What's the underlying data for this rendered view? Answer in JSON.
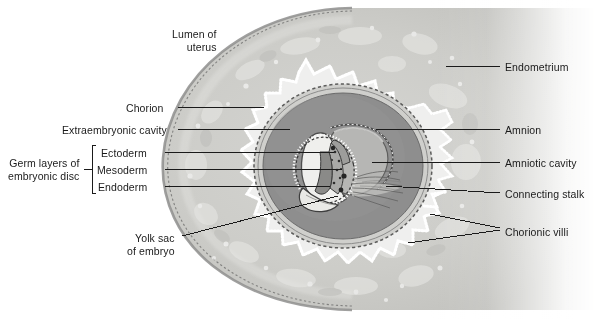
{
  "figure": {
    "background": "#ffffff"
  },
  "palette": {
    "endometrium_light": "#d8d8d6",
    "endometrium_mid": "#c9c9c6",
    "endometrium_rim": "#9a9a99",
    "extraembryonic_cavity": "#8e8e8e",
    "amniotic_cavity": "#b6b6b4",
    "yolk_sac": "#e9e9e6",
    "villi_white": "#fdfdfd",
    "line": "#1a1a1a",
    "text": "#1a1a1a"
  },
  "labels_left": [
    {
      "id": "lumen-of-uterus",
      "text": "Lumen of\nuterus",
      "x": 172,
      "y": 28,
      "leader": false
    },
    {
      "id": "chorion",
      "text": "Chorion",
      "x": 126,
      "y": 102,
      "leader": true
    },
    {
      "id": "extraembryonic-cavity",
      "text": "Extraembryonic cavity",
      "x": 62,
      "y": 124,
      "leader": true
    },
    {
      "id": "ectoderm",
      "text": "Ectoderm",
      "x": 101,
      "y": 147,
      "leader": true
    },
    {
      "id": "mesoderm",
      "text": "Mesoderm",
      "x": 97,
      "y": 164,
      "leader": true
    },
    {
      "id": "endoderm",
      "text": "Endoderm",
      "x": 98,
      "y": 181,
      "leader": true
    },
    {
      "id": "germ-layers-of-embryonic-disc",
      "text": "Germ layers of\nembryonic disc",
      "x": 8,
      "y": 157,
      "leader": false
    },
    {
      "id": "yolk-sac-of-embryo",
      "text": "Yolk sac\nof embryo",
      "x": 127,
      "y": 232,
      "leader": true
    }
  ],
  "labels_right": [
    {
      "id": "endometrium",
      "text": "Endometrium",
      "x": 505,
      "y": 61,
      "leader": true
    },
    {
      "id": "amnion",
      "text": "Amnion",
      "x": 505,
      "y": 124,
      "leader": true
    },
    {
      "id": "amniotic-cavity",
      "text": "Amniotic cavity",
      "x": 505,
      "y": 157,
      "leader": true
    },
    {
      "id": "connecting-stalk",
      "text": "Connecting stalk",
      "x": 505,
      "y": 188,
      "leader": true
    },
    {
      "id": "chorionic-villi",
      "text": "Chorionic villi",
      "x": 505,
      "y": 226,
      "leader": true
    }
  ],
  "structures": [
    {
      "id": "endometrium-mass",
      "name": "Endometrium"
    },
    {
      "id": "chorion-villi-ring",
      "name": "Chorion with chorionic villi"
    },
    {
      "id": "extraembryonic-cavity-region",
      "name": "Extraembryonic cavity"
    },
    {
      "id": "amniotic-cavity-region",
      "name": "Amniotic cavity"
    },
    {
      "id": "amnion-membrane",
      "name": "Amnion"
    },
    {
      "id": "embryonic-disc",
      "name": "Embryonic disc (ectoderm, mesoderm, endoderm)"
    },
    {
      "id": "yolk-sac-region",
      "name": "Yolk sac of embryo"
    },
    {
      "id": "connecting-stalk-region",
      "name": "Connecting stalk"
    },
    {
      "id": "lumen-region",
      "name": "Lumen of uterus"
    }
  ]
}
